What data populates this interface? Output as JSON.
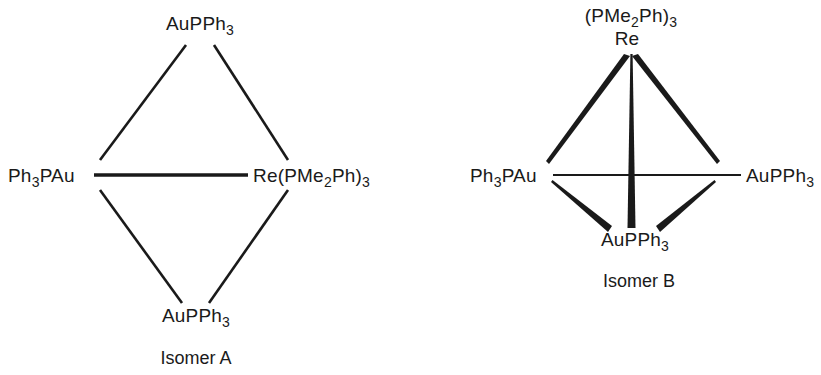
{
  "canvas": {
    "width": 821,
    "height": 375,
    "background": "#ffffff",
    "ink": "#1a1a1a"
  },
  "diagram_type": "chemical-structure-isomer-pair",
  "structures": [
    {
      "id": "isomer-a",
      "caption": "Isomer A",
      "geometry": "planar rhombus / butterfly, uniform bond lines",
      "vertices": [
        {
          "id": "a-top",
          "label_parts": [
            {
              "t": "AuPPh",
              "sub": false
            },
            {
              "t": "3",
              "sub": true
            }
          ],
          "label_plain": "AuPPh3",
          "x": 200,
          "y": 30,
          "anchor": "middle"
        },
        {
          "id": "a-left",
          "label_parts": [
            {
              "t": "Ph",
              "sub": false
            },
            {
              "t": "3",
              "sub": true
            },
            {
              "t": "PAu",
              "sub": false
            }
          ],
          "label_plain": "Ph3PAu",
          "x": 8,
          "y": 175,
          "anchor": "start"
        },
        {
          "id": "a-right",
          "label_parts": [
            {
              "t": "Re(PMe",
              "sub": false
            },
            {
              "t": "2",
              "sub": true
            },
            {
              "t": "Ph)",
              "sub": false
            },
            {
              "t": "3",
              "sub": true
            }
          ],
          "label_plain": "Re(PMe2Ph)3",
          "x": 253,
          "y": 175,
          "anchor": "start"
        },
        {
          "id": "a-bottom",
          "label_parts": [
            {
              "t": "AuPPh",
              "sub": false
            },
            {
              "t": "3",
              "sub": true
            }
          ],
          "label_plain": "AuPPh3",
          "x": 196,
          "y": 320,
          "anchor": "middle"
        }
      ],
      "bonds": [
        {
          "from": "a-top",
          "to": "a-left",
          "style": "line",
          "width": 2.6
        },
        {
          "from": "a-top",
          "to": "a-right",
          "style": "line",
          "width": 2.6
        },
        {
          "from": "a-left",
          "to": "a-bottom",
          "style": "line",
          "width": 2.6
        },
        {
          "from": "a-right",
          "to": "a-bottom",
          "style": "line",
          "width": 2.6
        },
        {
          "from": "a-left",
          "to": "a-right",
          "style": "line",
          "width": 3.4
        }
      ]
    },
    {
      "id": "isomer-b",
      "caption": "Isomer B",
      "geometry": "tetrahedral cluster, tapered wedge bonds",
      "vertices": [
        {
          "id": "b-apex-ligand",
          "label_parts": [
            {
              "t": "(PMe",
              "sub": false
            },
            {
              "t": "2",
              "sub": true
            },
            {
              "t": "Ph)",
              "sub": false
            },
            {
              "t": "3",
              "sub": true
            }
          ],
          "label_plain": "(PMe2Ph)3",
          "x": 631,
          "y": 22,
          "anchor": "middle"
        },
        {
          "id": "b-apex-metal",
          "label_parts": [
            {
              "t": "Re",
              "sub": false
            }
          ],
          "label_plain": "Re",
          "x": 631,
          "y": 45,
          "anchor": "middle"
        },
        {
          "id": "b-left",
          "label_parts": [
            {
              "t": "Ph",
              "sub": false
            },
            {
              "t": "3",
              "sub": true
            },
            {
              "t": "PAu",
              "sub": false
            }
          ],
          "label_plain": "Ph3PAu",
          "x": 470,
          "y": 175,
          "anchor": "start"
        },
        {
          "id": "b-right",
          "label_parts": [
            {
              "t": "AuPPh",
              "sub": false
            },
            {
              "t": "3",
              "sub": true
            }
          ],
          "label_plain": "AuPPh3",
          "x": 746,
          "y": 175,
          "anchor": "start"
        },
        {
          "id": "b-bottom",
          "label_parts": [
            {
              "t": "AuPPh",
              "sub": false
            },
            {
              "t": "3",
              "sub": true
            }
          ],
          "label_plain": "AuPPh3",
          "x": 635,
          "y": 243,
          "anchor": "middle"
        }
      ],
      "bonds": [
        {
          "from": "b-apex-metal",
          "to": "b-left",
          "style": "wedge",
          "thick_end": "from"
        },
        {
          "from": "b-apex-metal",
          "to": "b-right",
          "style": "wedge",
          "thick_end": "from"
        },
        {
          "from": "b-apex-metal",
          "to": "b-bottom",
          "style": "wedge",
          "thick_end": "to"
        },
        {
          "from": "b-left",
          "to": "b-bottom",
          "style": "wedge",
          "thick_end": "to"
        },
        {
          "from": "b-right",
          "to": "b-bottom",
          "style": "wedge",
          "thick_end": "to"
        },
        {
          "from": "b-left",
          "to": "b-right",
          "style": "line",
          "width": 2.2
        }
      ]
    }
  ],
  "captions": {
    "isomer_a": "Isomer A",
    "isomer_b": "Isomer B"
  },
  "labels": {
    "a_top": "AuPPh3",
    "a_left": "Ph3PAu",
    "a_right": "Re(PMe2Ph)3",
    "a_bottom": "AuPPh3",
    "b_apex_ligand": "(PMe2Ph)3",
    "b_apex_metal": "Re",
    "b_left": "Ph3PAu",
    "b_right": "AuPPh3",
    "b_bottom": "AuPPh3"
  }
}
